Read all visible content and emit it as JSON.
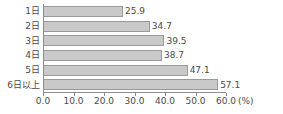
{
  "chart_data": {
    "type": "bar",
    "orientation": "horizontal",
    "title": "",
    "subtitle": "",
    "xlabel": "",
    "ylabel": "",
    "unit_label": "(%)",
    "categories": [
      "1日",
      "2日",
      "3日",
      "4日",
      "5日",
      "6日以上"
    ],
    "values": [
      25.9,
      34.7,
      39.5,
      38.7,
      47.1,
      57.1
    ],
    "value_labels": [
      "25.9",
      "34.7",
      "39.5",
      "38.7",
      "47.1",
      "57.1"
    ],
    "xlim": [
      0.0,
      60.0
    ],
    "xticks": [
      0.0,
      10.0,
      20.0,
      30.0,
      40.0,
      50.0,
      60.0
    ],
    "xtick_labels": [
      "0.0",
      "10.0",
      "20.0",
      "30.0",
      "40.0",
      "50.0",
      "60.0"
    ],
    "grid": false,
    "legend": null,
    "legend_position": "none",
    "bar_color": "#c9c9c9",
    "bar_border_color": "#9a9a9a",
    "axis_color": "#8c8c8c",
    "text_color": "#4a4a4a",
    "background": "#ffffff"
  }
}
